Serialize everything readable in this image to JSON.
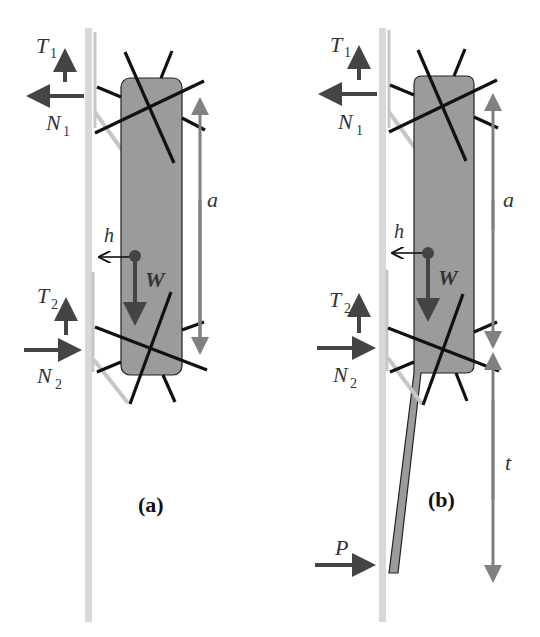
{
  "figure": {
    "panels": [
      {
        "caption": "(a)",
        "labels": {
          "T1": "T",
          "T1_sub": "1",
          "N1": "N",
          "N1_sub": "1",
          "T2": "T",
          "T2_sub": "2",
          "N2": "N",
          "N2_sub": "2",
          "a": "a",
          "h": "h",
          "W": "W"
        }
      },
      {
        "caption": "(b)",
        "labels": {
          "T1": "T",
          "T1_sub": "1",
          "N1": "N",
          "N1_sub": "1",
          "T2": "T",
          "T2_sub": "2",
          "N2": "N",
          "N2_sub": "2",
          "a": "a",
          "h": "h",
          "W": "W",
          "t": "t",
          "P": "P"
        }
      }
    ],
    "colors": {
      "pole": "#d6d6d6",
      "bracket": "#c8c8c8",
      "body_fill": "#9b9b9b",
      "body_stroke": "#222222",
      "spikes": "#111111",
      "force_arrow": "#444444",
      "dimension_arrow": "#808080"
    }
  }
}
